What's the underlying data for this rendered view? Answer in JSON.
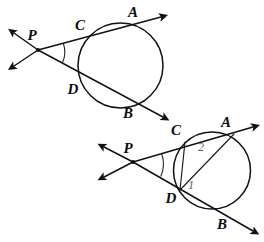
{
  "figure": {
    "background_color": "#ffffff",
    "line_color": "#111111",
    "angle_label_color": "#5b5b5b",
    "width": 264,
    "height": 242
  },
  "diagrams": [
    {
      "id": "top-diagram",
      "name": "secants-from-external-point",
      "circle": {
        "cx": 120.5,
        "cy": 65.5,
        "r": 42.5
      },
      "external_point": {
        "label": "P",
        "x": 38,
        "y": 50,
        "label_x": 32,
        "label_y": 37
      },
      "secants": [
        {
          "name": "secant-PCA",
          "near_intersection": {
            "label": "C",
            "x": 88,
            "y": 38,
            "label_x": 80,
            "label_y": 27
          },
          "far_intersection": {
            "label": "A",
            "x": 142,
            "y": 25,
            "label_x": 133,
            "label_y": 14
          },
          "ray_end": {
            "x": 161,
            "y": 17
          }
        },
        {
          "name": "secant-PDB",
          "near_intersection": {
            "label": "D",
            "x": 84,
            "y": 82,
            "label_x": 73,
            "label_y": 91
          },
          "far_intersection": {
            "label": "B",
            "x": 140,
            "y": 106,
            "label_x": 128,
            "label_y": 115
          },
          "ray_end": {
            "x": 163,
            "y": 117
          }
        }
      ],
      "back_rays": [
        {
          "name": "back-ray-upper-left",
          "x": 14,
          "y": 33
        },
        {
          "name": "back-ray-lower-left",
          "x": 14,
          "y": 66
        }
      ],
      "angle_arc": {
        "name": "angle-arc-at-P",
        "radius": 26
      },
      "chords": []
    },
    {
      "id": "bottom-diagram",
      "name": "secants-with-inscribed-angles",
      "circle": {
        "cx": 212,
        "cy": 170.5,
        "r": 38.5
      },
      "external_point": {
        "label": "P",
        "x": 133,
        "y": 162,
        "label_x": 128,
        "label_y": 150
      },
      "secants": [
        {
          "name": "secant-PCA",
          "near_intersection": {
            "label": "C",
            "x": 185,
            "y": 142,
            "label_x": 176,
            "label_y": 132
          },
          "far_intersection": {
            "label": "A",
            "x": 234,
            "y": 134,
            "label_x": 226,
            "label_y": 124
          },
          "ray_end": {
            "x": 253,
            "y": 127
          }
        },
        {
          "name": "secant-PDB",
          "near_intersection": {
            "label": "D",
            "x": 180,
            "y": 190,
            "label_x": 171,
            "label_y": 200
          },
          "far_intersection": {
            "label": "B",
            "x": 229,
            "y": 213,
            "label_x": 222,
            "label_y": 226
          },
          "ray_end": {
            "x": 253,
            "y": 231
          }
        }
      ],
      "back_rays": [
        {
          "name": "back-ray-upper-left",
          "x": 104,
          "y": 147
        },
        {
          "name": "back-ray-lower-left",
          "x": 104,
          "y": 177
        }
      ],
      "angle_arc": {
        "name": "angle-arc-at-P",
        "radius": 30
      },
      "chords": [
        {
          "name": "chord-DA",
          "from": {
            "x": 180,
            "y": 190
          },
          "to": {
            "x": 234,
            "y": 134
          }
        },
        {
          "name": "chord-CD",
          "from": {
            "x": 185,
            "y": 142
          },
          "to": {
            "x": 180,
            "y": 190
          }
        }
      ],
      "angle_labels": [
        {
          "name": "angle-label-2",
          "text": "2",
          "x": 201,
          "y": 148
        },
        {
          "name": "angle-label-1",
          "text": "1",
          "x": 191,
          "y": 186
        }
      ]
    }
  ],
  "labels": {
    "top": {
      "P": "P",
      "C": "C",
      "A": "A",
      "D": "D",
      "B": "B"
    },
    "bottom": {
      "P": "P",
      "C": "C",
      "A": "A",
      "D": "D",
      "B": "B",
      "angle1": "1",
      "angle2": "2"
    }
  }
}
